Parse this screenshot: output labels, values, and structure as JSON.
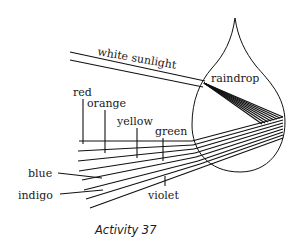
{
  "diagram": {
    "caption": "Activity 37",
    "labels": {
      "sunlight": "white sunlight",
      "raindrop": "raindrop",
      "red": "red",
      "orange": "orange",
      "yellow": "yellow",
      "green": "green",
      "blue": "blue",
      "indigo": "indigo",
      "violet": "violet"
    },
    "colors": {
      "stroke": "#111111",
      "background": "#ffffff"
    }
  }
}
